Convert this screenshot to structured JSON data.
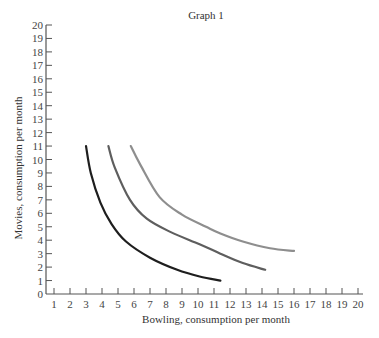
{
  "chart_data": {
    "type": "line",
    "title": "Graph 1",
    "xlabel": "Bowling, consumption per month",
    "ylabel": "Movies, consumption per month",
    "xlim": [
      0,
      20
    ],
    "ylim": [
      0,
      20
    ],
    "x_ticks": [
      1,
      2,
      3,
      4,
      5,
      6,
      7,
      8,
      9,
      10,
      11,
      12,
      13,
      14,
      15,
      16,
      17,
      18,
      19,
      20
    ],
    "y_ticks": [
      0,
      1,
      2,
      3,
      4,
      5,
      6,
      7,
      8,
      9,
      10,
      11,
      12,
      13,
      14,
      15,
      16,
      17,
      18,
      19,
      20
    ],
    "grid": false,
    "legend": null,
    "series": [
      {
        "name": "Indifference curve 1",
        "color": "#1e1e1e",
        "points": [
          [
            3.0,
            11.0
          ],
          [
            3.3,
            9.0
          ],
          [
            3.9,
            6.8
          ],
          [
            4.6,
            5.2
          ],
          [
            5.5,
            3.9
          ],
          [
            7.0,
            2.7
          ],
          [
            8.7,
            1.8
          ],
          [
            10.1,
            1.3
          ],
          [
            11.4,
            1.0
          ]
        ]
      },
      {
        "name": "Indifference curve 2",
        "color": "#5e5e5e",
        "points": [
          [
            4.4,
            11.0
          ],
          [
            4.8,
            9.4
          ],
          [
            5.75,
            7.0
          ],
          [
            6.8,
            5.6
          ],
          [
            8.3,
            4.6
          ],
          [
            10.1,
            3.7
          ],
          [
            11.4,
            3.0
          ],
          [
            12.8,
            2.3
          ],
          [
            14.2,
            1.8
          ]
        ]
      },
      {
        "name": "Indifference curve 3",
        "color": "#8e8e8e",
        "points": [
          [
            5.8,
            11.0
          ],
          [
            6.4,
            9.6
          ],
          [
            7.6,
            7.2
          ],
          [
            9.0,
            5.9
          ],
          [
            10.5,
            5.0
          ],
          [
            11.4,
            4.5
          ],
          [
            12.8,
            3.9
          ],
          [
            14.5,
            3.4
          ],
          [
            16.0,
            3.2
          ]
        ]
      }
    ]
  }
}
